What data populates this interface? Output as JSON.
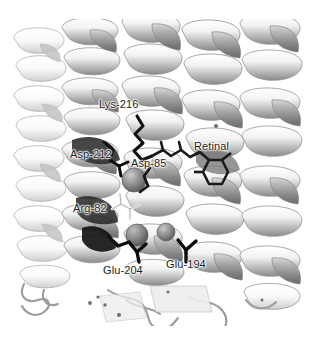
{
  "figure": {
    "kind": "molecular-structure-ribbon-diagram",
    "background_color": "#ffffff",
    "rendering": "grayscale cartoon ribbon with stick side chains and sphere waters",
    "width_px": 314,
    "height_px": 342
  },
  "labels": {
    "lys216": "Lys-216",
    "asp212": "Asp-212",
    "asp85": "Asp-85",
    "retinal": "Retinal",
    "arg82": "Arg-82",
    "glu204": "Glu-204",
    "glu194": "Glu-194"
  },
  "palette": {
    "background": "#ffffff",
    "ribbon_light": "#fbfbfb",
    "ribbon_mid": "#c9c9c9",
    "ribbon_shadow": "#8e8e8e",
    "ribbon_dark": "#6a6a6a",
    "ribbon_outline": "#9a9a9a",
    "sidechain_black": "#111111",
    "sidechain_outline": "#f2f2f2",
    "water_sphere": "#8f8f8f",
    "water_sphere_dark": "#6e6e6e",
    "label_text": "#1c1c1c",
    "coil_stroke": "#9c9c9c"
  },
  "scene": {
    "helices": [
      {
        "name": "helix-left-outer",
        "x": 38,
        "shade": "light"
      },
      {
        "name": "helix-left-inner",
        "x": 92,
        "shade": "mid"
      },
      {
        "name": "helix-center",
        "x": 150,
        "shade": "mid"
      },
      {
        "name": "helix-right-inner",
        "x": 205,
        "shade": "mid"
      },
      {
        "name": "helix-right-outer",
        "x": 268,
        "shade": "light"
      }
    ],
    "water_spheres": [
      {
        "name": "water-central",
        "cx": 134,
        "cy": 180,
        "r": 12
      },
      {
        "name": "water-lower",
        "cx": 137,
        "cy": 235,
        "r": 11
      },
      {
        "name": "water-right",
        "cx": 166,
        "cy": 232,
        "r": 9
      }
    ],
    "markers": [
      {
        "name": "water-dot-upper-right",
        "cx": 216,
        "cy": 126
      },
      {
        "name": "water-dot-lower-a",
        "cx": 90,
        "cy": 303
      },
      {
        "name": "water-dot-lower-b",
        "cx": 98,
        "cy": 297
      },
      {
        "name": "water-dot-lower-c",
        "cx": 105,
        "cy": 305
      },
      {
        "name": "water-dot-lower-d",
        "cx": 119,
        "cy": 315
      }
    ]
  }
}
